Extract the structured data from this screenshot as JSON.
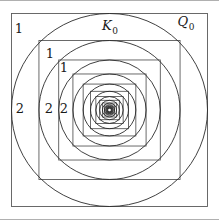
{
  "figure": {
    "caption_labels": {
      "outer_square_label": "Q",
      "outer_square_subscript": "0",
      "outer_circle_label": "K",
      "outer_circle_subscript": "0"
    },
    "region_labels": [
      {
        "name": "region-1-outer",
        "text": "1",
        "x": 19,
        "y": 28
      },
      {
        "name": "region-1-second",
        "text": "1",
        "x": 50,
        "y": 53
      },
      {
        "name": "region-1-third",
        "text": "1",
        "x": 64,
        "y": 67
      },
      {
        "name": "region-2-outer",
        "text": "2",
        "x": 20,
        "y": 108
      },
      {
        "name": "region-2-second",
        "text": "2",
        "x": 49,
        "y": 108
      },
      {
        "name": "region-2-third",
        "text": "2",
        "x": 64,
        "y": 108
      }
    ],
    "set_labels": [
      {
        "name": "label-K0",
        "base": "K",
        "sub": "0",
        "x": 110,
        "y": 27
      },
      {
        "name": "label-Q0",
        "base": "Q",
        "sub": "0",
        "x": 186,
        "y": 23
      }
    ],
    "geometry": {
      "center_x": 109.5,
      "center_y": 110,
      "outer_square_left": 11.5,
      "outer_square_top": 12.5,
      "outer_square_right": 207.5,
      "outer_square_bottom": 205.5,
      "scale_ratio": 0.72,
      "nesting_count": 13
    },
    "colors": {
      "stroke": "#2b2b2b",
      "square_stroke": "#5a5a5a",
      "background": "#ffffff",
      "rule": "#b0b0b0",
      "text": "#1a1a1a"
    }
  }
}
